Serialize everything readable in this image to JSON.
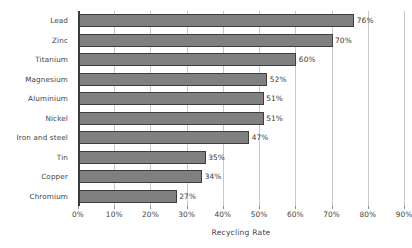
{
  "chart_data": {
    "type": "bar",
    "orientation": "horizontal",
    "title": "",
    "xlabel": "Recycling Rate",
    "ylabel": "",
    "categories": [
      "Lead",
      "Zinc",
      "Titanium",
      "Magnesium",
      "Aluminium",
      "Nickel",
      "Iron and steel",
      "Tin",
      "Copper",
      "Chromium"
    ],
    "values": [
      76,
      70,
      60,
      52,
      51,
      51,
      47,
      35,
      34,
      27
    ],
    "data_labels": [
      "76%",
      "70%",
      "60%",
      "52%",
      "51%",
      "51%",
      "47%",
      "35%",
      "34%",
      "27%"
    ],
    "xlim": [
      0,
      90
    ],
    "xtick_values": [
      0,
      10,
      20,
      30,
      40,
      50,
      60,
      70,
      80,
      90
    ],
    "xtick_labels": [
      "0%",
      "10%",
      "20%",
      "30%",
      "40%",
      "50%",
      "60%",
      "70%",
      "80%",
      "90%"
    ],
    "grid": true,
    "grid_axis": "x",
    "legend": false,
    "bar_color": "#808080",
    "bar_edge_color": "#3d3d3d",
    "gridline_color": "#c9c9c9",
    "axis_color": "#3a3a3a",
    "text_color": "#444444",
    "background_color": "#ffffff"
  }
}
